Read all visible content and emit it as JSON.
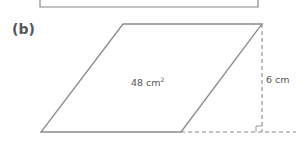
{
  "figure": {
    "part_label": "(b)",
    "shape": "parallelogram",
    "area": {
      "value": "48 cm",
      "exponent": "2"
    },
    "height": "6 cm",
    "colors": {
      "line": "#8a8a8a",
      "text": "#555555",
      "background": "#ffffff"
    }
  }
}
